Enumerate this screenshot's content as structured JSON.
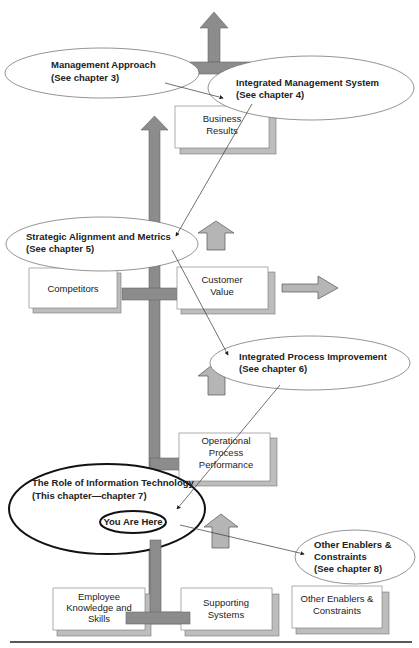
{
  "diagram": {
    "ellipses": [
      {
        "id": "management-approach",
        "line1": "Management Approach",
        "line2": "(See chapter 3)"
      },
      {
        "id": "integrated-management-system",
        "line1": "Integrated Management System",
        "line2": "(See chapter 4)"
      },
      {
        "id": "strategic-alignment",
        "line1": "Strategic Alignment and Metrics",
        "line2": "(See chapter 5)"
      },
      {
        "id": "integrated-process-improvement",
        "line1": "Integrated Process Improvement",
        "line2": "(See chapter 6)"
      },
      {
        "id": "role-of-it",
        "line1": "The Role of Information Technology",
        "line2": "(This chapter—chapter 7)"
      },
      {
        "id": "you-are-here",
        "line1": "You Are Here"
      },
      {
        "id": "other-enablers-ellipse",
        "line1": "Other Enablers &",
        "line2": "Constraints",
        "line3": "(See chapter 8)"
      }
    ],
    "boxes": [
      {
        "id": "business-results",
        "line1": "Business",
        "line2": "Results"
      },
      {
        "id": "competitors",
        "line1": "Competitors"
      },
      {
        "id": "customer-value",
        "line1": "Customer",
        "line2": "Value"
      },
      {
        "id": "operational-process",
        "line1": "Operational",
        "line2": "Process",
        "line3": "Performance"
      },
      {
        "id": "employee-knowledge",
        "line1": "Employee",
        "line2": "Knowledge and",
        "line3": "Skills"
      },
      {
        "id": "supporting-systems",
        "line1": "Supporting",
        "line2": "Systems"
      },
      {
        "id": "other-enablers-box",
        "line1": "Other Enablers &",
        "line2": "Constraints"
      }
    ],
    "colors": {
      "structure": "#8c8c8c",
      "shadow": "#bdbdbd",
      "arrow_fill": "#b5b5b5",
      "line": "#333333"
    }
  }
}
